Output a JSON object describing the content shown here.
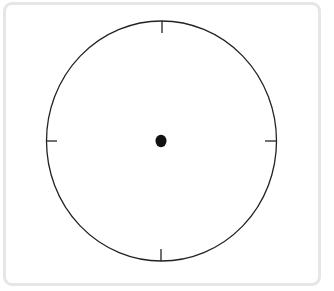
{
  "figure": {
    "type": "blank-clock-face",
    "frame": {
      "border_color": "#e6e6e6",
      "background": "#ffffff"
    },
    "clock": {
      "outline_color": "#222222",
      "center_dot_color": "#111111",
      "tick_count": 4,
      "tick_positions": [
        "12",
        "3",
        "6",
        "9"
      ],
      "hands": []
    }
  },
  "icons": {
    "frame": "rounded-frame",
    "face": "clock-face-icon",
    "center": "center-dot-icon"
  }
}
